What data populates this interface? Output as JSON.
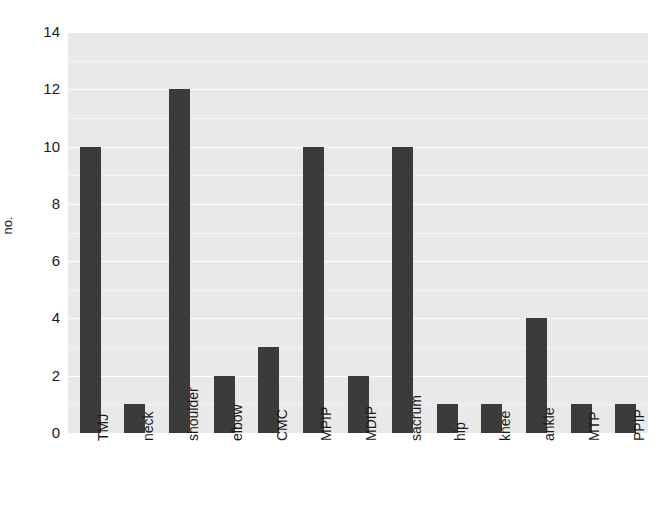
{
  "chart_data": {
    "type": "bar",
    "title": "",
    "subtitle": "",
    "xlabel": "",
    "ylabel": "no.",
    "categories": [
      "TMJ",
      "neck",
      "shoulder",
      "elbow",
      "CMC",
      "MPIP",
      "MDIP",
      "sacrum",
      "hip",
      "knee",
      "ankle",
      "MTP",
      "PPIP"
    ],
    "values": [
      10,
      1,
      12,
      2,
      3,
      10,
      2,
      10,
      1,
      1,
      4,
      1,
      1
    ],
    "ylim": [
      0,
      14
    ],
    "y_ticks": [
      0,
      2,
      4,
      6,
      8,
      10,
      12,
      14
    ],
    "y_tick_labels": [
      "0",
      "2",
      "4",
      "6",
      "8",
      "10",
      "12",
      "14"
    ],
    "grid": "horizontal",
    "gridline_values": [
      1,
      2,
      3,
      4,
      5,
      6,
      7,
      8,
      9,
      10,
      11,
      12,
      13,
      14
    ],
    "legend": null,
    "legend_position": "none",
    "x_tick_rotation": -90,
    "bar_color": "#3b3b3b",
    "panel_background": "#e9e9e9",
    "gridline_color": "#ffffff",
    "figure_background": "#ffffff",
    "text_color": "#1a1a1a"
  }
}
